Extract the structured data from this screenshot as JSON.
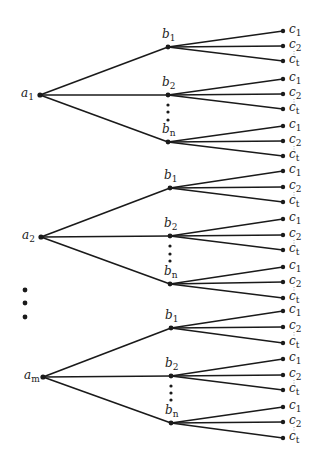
{
  "diagram": {
    "type": "tree",
    "colors": {
      "line": "#1a1a1a",
      "background": "#ffffff"
    },
    "groups": [
      {
        "root": {
          "base": "a",
          "sub": "1",
          "x": 40,
          "y": 95
        },
        "children": [
          {
            "base": "b",
            "sub": "1",
            "x": 168,
            "y": 47,
            "leaves": [
              31,
              46,
              61
            ]
          },
          {
            "base": "b",
            "sub": "2",
            "x": 168,
            "y": 95,
            "leaves": [
              79,
              94,
              109
            ]
          },
          {
            "base": "b",
            "sub": "n",
            "x": 168,
            "y": 142,
            "leaves": [
              126,
              141,
              156
            ]
          }
        ],
        "ellipsis_y": [
          105,
          112,
          120
        ]
      },
      {
        "root": {
          "base": "a",
          "sub": "2",
          "x": 41,
          "y": 237
        },
        "children": [
          {
            "base": "b",
            "sub": "1",
            "x": 170,
            "y": 188,
            "leaves": [
              171,
              187,
              202
            ]
          },
          {
            "base": "b",
            "sub": "2",
            "x": 170,
            "y": 236,
            "leaves": [
              219,
              235,
              250
            ]
          },
          {
            "base": "b",
            "sub": "n",
            "x": 170,
            "y": 284,
            "leaves": [
              267,
              282,
              298
            ]
          }
        ],
        "ellipsis_y": [
          246,
          254,
          261
        ]
      },
      {
        "root": {
          "base": "a",
          "sub": "m",
          "x": 43,
          "y": 377
        },
        "children": [
          {
            "base": "b",
            "sub": "1",
            "x": 171,
            "y": 328,
            "leaves": [
              311,
              327,
              343
            ]
          },
          {
            "base": "b",
            "sub": "2",
            "x": 171,
            "y": 376,
            "leaves": [
              359,
              375,
              390
            ]
          },
          {
            "base": "b",
            "sub": "n",
            "x": 171,
            "y": 423,
            "leaves": [
              407,
              422,
              438
            ]
          }
        ],
        "ellipsis_y": [
          386,
          393,
          400
        ]
      }
    ],
    "leaf_x": 283,
    "leaf_labels": [
      {
        "base": "c",
        "sub": "1"
      },
      {
        "base": "c",
        "sub": "2"
      },
      {
        "base": "c",
        "sub": "t"
      }
    ],
    "root_ellipsis": {
      "x": 25,
      "y": [
        290,
        303,
        317
      ]
    }
  }
}
